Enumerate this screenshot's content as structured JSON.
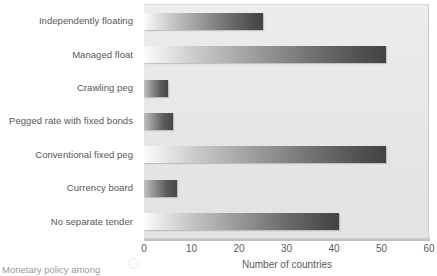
{
  "chart_data": {
    "type": "bar",
    "orientation": "horizontal",
    "title": "",
    "subtitle": "",
    "xlabel": "Number of countries",
    "ylabel": "",
    "xlim": [
      0,
      60
    ],
    "xticks": [
      0,
      10,
      20,
      30,
      40,
      50,
      60
    ],
    "xtick_labels": [
      "0",
      "10",
      "20",
      "30",
      "40",
      "50",
      "60"
    ],
    "grid": false,
    "legend": null,
    "categories": [
      "Independently floating",
      "Managed float",
      "Crawling peg",
      "Pegged rate with fixed bonds",
      "Conventional fixed peg",
      "Currency board",
      "No separate tender"
    ],
    "values": [
      25,
      51,
      5,
      6,
      51,
      7,
      41
    ],
    "bar_fill": "horizontal-gradient-white-to-darkgray",
    "plot_background": "#e8e8e8"
  },
  "caption": {
    "text": "Monetary policy among"
  },
  "icons": {
    "caption_mark": "circle-icon"
  },
  "colors": {
    "plot_bg": "#e8e8e8",
    "bar_light": "#fbfbfb",
    "bar_dark": "#434343",
    "text": "#56565a",
    "axis": "#c9c9c9"
  }
}
